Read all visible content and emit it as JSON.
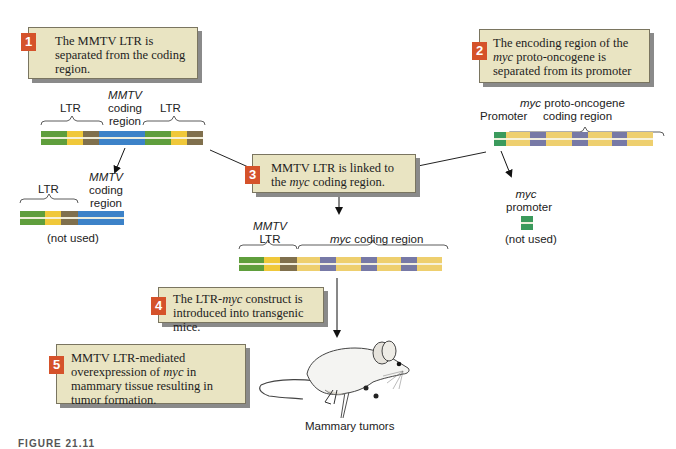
{
  "steps": [
    {
      "num": "1",
      "text": "The MMTV LTR is separated from the coding region."
    },
    {
      "num": "2",
      "text_pre": "The encoding region of the ",
      "text_em": "myc",
      "text_post": " proto-oncogene is separated from its promoter"
    },
    {
      "num": "3",
      "text_pre": "MMTV LTR is linked to the ",
      "text_em": "myc",
      "text_post": " coding region."
    },
    {
      "num": "4",
      "text_pre": "The LTR-",
      "text_em": "myc",
      "text_post": " construct is introduced into transgenic mice."
    },
    {
      "num": "5",
      "text_pre": "MMTV LTR-mediated overexpression of ",
      "text_em": "myc",
      "text_post": " in mammary tissue resulting in tumor formation."
    }
  ],
  "mmtv_gene": {
    "ltr_left": "LTR",
    "coding_em": "MMTV",
    "coding_line2": "coding",
    "coding_line3": "region",
    "ltr_right": "LTR"
  },
  "mmtv_unused": {
    "ltr": "LTR",
    "coding_em": "MMTV",
    "coding_line2": "coding",
    "coding_line3": "region",
    "note": "(not used)"
  },
  "myc_gene": {
    "promoter": "Promoter",
    "coding_em": "myc",
    "coding_line1_rest": " proto-oncogene",
    "coding_line2": "coding region"
  },
  "myc_unused": {
    "em": "myc",
    "line2": "promoter",
    "note": "(not used)"
  },
  "construct": {
    "ltr_em": "MMTV",
    "ltr_line2": "LTR",
    "coding_em": "myc",
    "coding_rest": " coding region"
  },
  "mouse": {
    "label": "Mammary tumors"
  },
  "caption": {
    "text": "FIGURE 21.11"
  },
  "colors": {
    "box_bg": "#e9e4c2",
    "step_badge": "#d5522a",
    "ltr_green": "#5f9e3c",
    "ltr_yellow": "#f0c83a",
    "ltr_brown": "#80704d",
    "mmtv_blue": "#3c82c8",
    "myc_yellow": "#eecf6e",
    "myc_purple": "#7779a6",
    "promoter_green": "#3b9a5c"
  }
}
